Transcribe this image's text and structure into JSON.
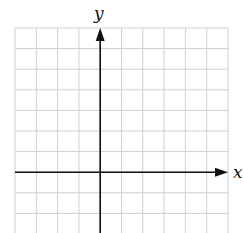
{
  "figure": {
    "type": "cartesian-grid",
    "x_axis_label": "x",
    "y_axis_label": "y",
    "grid": {
      "columns": 10,
      "rows_visible": 10,
      "x_lines": [
        15,
        36.3,
        57.6,
        78.9,
        100.2,
        121.5,
        142.8,
        164.1,
        185.4,
        206.7,
        228
      ],
      "y_lines": [
        28,
        48.6,
        69.2,
        89.8,
        110.4,
        131,
        151.6,
        172.2,
        192.8,
        213.4,
        234
      ],
      "line_color": "#cfcfcf",
      "axis_color": "#111111"
    },
    "origin_px": {
      "x": 100.2,
      "y": 172.2
    },
    "x_axis": {
      "from": 15,
      "to": 228,
      "arrow": "right"
    },
    "y_axis": {
      "from": 233,
      "to": 28,
      "arrow": "up"
    },
    "unit_squares": {
      "left_of_origin": 4,
      "right_of_origin": 6,
      "above_origin": 7,
      "below_origin": 3
    }
  }
}
